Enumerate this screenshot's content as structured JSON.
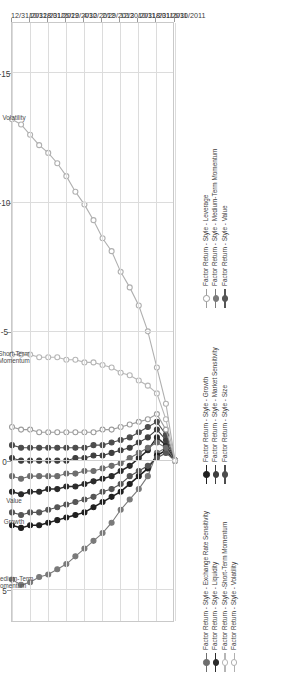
{
  "figure": {
    "kind": "line-chart",
    "orientation": "rotated-90"
  },
  "legend": {
    "entries": [
      {
        "label": "Factor Return - Style - Exchange Rate Sensitivity",
        "color": "#6e6e6e",
        "marker": "filled",
        "column": 0
      },
      {
        "label": "Factor Return - Style - Liquidity",
        "color": "#2b2b2b",
        "marker": "filled",
        "column": 0
      },
      {
        "label": "Factor Return - Style -Short-Term Momentum",
        "color": "#b6b6b6",
        "marker": "open",
        "column": 0
      },
      {
        "label": "Factor Return - Style - Volatility",
        "color": "#b0b0b0",
        "marker": "open",
        "column": 0
      },
      {
        "label": "Factor Return - Style - Growth",
        "color": "#202020",
        "marker": "filled",
        "column": 1
      },
      {
        "label": "Factor Return - Style - Market Sensitivity",
        "color": "#3f3f3f",
        "marker": "filled",
        "column": 1
      },
      {
        "label": "Factor Return - Style - Size",
        "color": "#4d4d4d",
        "marker": "filled",
        "column": 1
      },
      {
        "label": "Factor Return - Style - Leverage",
        "color": "#9d9d9d",
        "marker": "open",
        "column": 2
      },
      {
        "label": "Factor Return - Style - Medium-Term Momentum",
        "color": "#7a7a7a",
        "marker": "filled",
        "column": 2
      },
      {
        "label": "Factor Return - Style - Value",
        "color": "#565656",
        "marker": "filled",
        "column": 2
      }
    ]
  },
  "annotations": [
    {
      "text": "Medium-Term\nMomentum",
      "value": 4.6
    },
    {
      "text": "Growth",
      "value": 2.4
    },
    {
      "text": "Value",
      "value": 1.6
    },
    {
      "text": "Short-Term\nMomentum",
      "value": -4.1
    },
    {
      "text": "Volatility",
      "value": -13.2
    }
  ],
  "chart_data": {
    "type": "line",
    "title": "",
    "xlabel": "",
    "ylabel": "",
    "value_axis": {
      "ticks": [
        "5",
        "0",
        "-5",
        "-10",
        "-15"
      ],
      "tick_values": [
        5,
        0,
        -5,
        -10,
        -15
      ],
      "range": [
        6.2,
        -17.0
      ],
      "grid": true
    },
    "date_axis": {
      "ticks": [
        "6/30/2011",
        "8/31/2011",
        "10/31/2011",
        "12/30/2011",
        "2/29/2012",
        "4/30/2012",
        "6/29/2012",
        "8/31/2012",
        "10/31/2012",
        "12/31/2012"
      ],
      "grid": true
    },
    "x": [
      "6/30/2011",
      "7/29/2011",
      "8/31/2011",
      "9/30/2011",
      "10/31/2011",
      "11/30/2011",
      "12/30/2011",
      "1/31/2012",
      "2/29/2012",
      "3/30/2012",
      "4/30/2012",
      "5/31/2012",
      "6/29/2012",
      "7/31/2012",
      "8/31/2012",
      "9/28/2012",
      "10/31/2012",
      "11/30/2012",
      "12/31/2012"
    ],
    "series": [
      {
        "name": "Factor Return - Style - Medium-Term Momentum",
        "color": "#7a7a7a",
        "marker": "filled",
        "values": [
          0,
          -0.5,
          -0.3,
          0.6,
          1.1,
          1.5,
          1.9,
          2.4,
          2.8,
          3.1,
          3.4,
          3.7,
          4.0,
          4.2,
          4.4,
          4.5,
          4.7,
          4.8,
          4.6
        ]
      },
      {
        "name": "Factor Return - Style - Growth",
        "color": "#202020",
        "marker": "filled",
        "values": [
          0,
          -0.4,
          -0.2,
          0.3,
          0.6,
          0.9,
          1.2,
          1.4,
          1.6,
          1.8,
          2.0,
          2.1,
          2.2,
          2.3,
          2.4,
          2.5,
          2.5,
          2.6,
          2.5
        ]
      },
      {
        "name": "Factor Return - Style - Value",
        "color": "#565656",
        "marker": "filled",
        "values": [
          0,
          -0.3,
          -0.1,
          0.2,
          0.4,
          0.6,
          0.9,
          1.1,
          1.2,
          1.4,
          1.5,
          1.6,
          1.7,
          1.8,
          1.9,
          2.0,
          2.0,
          2.1,
          2.0
        ]
      },
      {
        "name": "Factor Return - Style - Liquidity",
        "color": "#2b2b2b",
        "marker": "filled",
        "values": [
          0,
          -0.6,
          -0.9,
          -0.4,
          -0.1,
          0.2,
          0.4,
          0.6,
          0.7,
          0.8,
          0.9,
          1.0,
          1.0,
          1.1,
          1.1,
          1.2,
          1.2,
          1.3,
          1.2
        ]
      },
      {
        "name": "Factor Return - Style - Exchange Rate Sensitivity",
        "color": "#6e6e6e",
        "marker": "filled",
        "values": [
          0,
          -0.5,
          -0.7,
          -0.5,
          -0.3,
          -0.1,
          0.1,
          0.2,
          0.3,
          0.4,
          0.4,
          0.5,
          0.5,
          0.6,
          0.6,
          0.6,
          0.6,
          0.7,
          0.6
        ]
      },
      {
        "name": "Factor Return - Style - Market Sensitivity",
        "color": "#3f3f3f",
        "marker": "filled",
        "values": [
          0,
          -0.8,
          -1.2,
          -0.9,
          -0.7,
          -0.5,
          -0.4,
          -0.3,
          -0.2,
          -0.2,
          -0.1,
          -0.1,
          0.0,
          0.0,
          0.0,
          0.0,
          0.0,
          0.0,
          -0.1
        ]
      },
      {
        "name": "Factor Return - Style - Size",
        "color": "#4d4d4d",
        "marker": "filled",
        "values": [
          0,
          -1.0,
          -1.5,
          -1.3,
          -1.1,
          -0.9,
          -0.8,
          -0.7,
          -0.6,
          -0.6,
          -0.5,
          -0.5,
          -0.5,
          -0.5,
          -0.5,
          -0.5,
          -0.5,
          -0.5,
          -0.6
        ]
      },
      {
        "name": "Factor Return - Style - Leverage",
        "color": "#9d9d9d",
        "marker": "open",
        "values": [
          0,
          -1.2,
          -1.8,
          -1.6,
          -1.5,
          -1.4,
          -1.3,
          -1.2,
          -1.2,
          -1.1,
          -1.1,
          -1.1,
          -1.1,
          -1.1,
          -1.1,
          -1.1,
          -1.2,
          -1.2,
          -1.3
        ]
      },
      {
        "name": "Factor Return - Style -Short-Term Momentum",
        "color": "#b6b6b6",
        "marker": "open",
        "values": [
          0,
          -1.6,
          -2.6,
          -2.9,
          -3.1,
          -3.3,
          -3.4,
          -3.6,
          -3.7,
          -3.8,
          -3.8,
          -3.9,
          -3.9,
          -4.0,
          -4.0,
          -4.0,
          -4.1,
          -4.1,
          -4.1
        ]
      },
      {
        "name": "Factor Return - Style - Volatility",
        "color": "#b0b0b0",
        "marker": "open",
        "values": [
          0,
          -2.2,
          -3.6,
          -5.0,
          -6.0,
          -6.7,
          -7.3,
          -8.1,
          -8.6,
          -9.3,
          -9.9,
          -10.4,
          -11.0,
          -11.5,
          -11.9,
          -12.2,
          -12.6,
          -13.0,
          -13.2
        ]
      }
    ]
  }
}
